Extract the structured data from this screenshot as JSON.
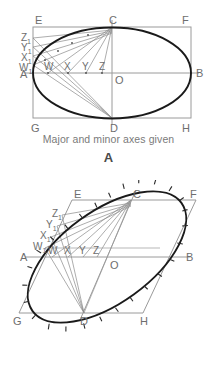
{
  "figures": [
    {
      "id": "A",
      "caption": "Major and minor axes given",
      "letter": "A",
      "labels": {
        "E": "E",
        "C": "C",
        "F": "F",
        "A": "A",
        "B": "B",
        "O": "O",
        "G": "G",
        "D": "D",
        "H": "H",
        "W": "W",
        "X": "X",
        "Y": "Y",
        "Z": "Z",
        "W1": "W",
        "X1": "X",
        "Y1": "Y",
        "Z1": "Z",
        "sub": "1"
      }
    },
    {
      "id": "B",
      "caption": "Conjugate diameters given",
      "letter": "B",
      "labels": {
        "E": "E",
        "C": "C",
        "F": "F",
        "A": "A",
        "B": "B",
        "O": "O",
        "G": "G",
        "D": "D",
        "H": "H",
        "W": "W",
        "X": "X",
        "Y": "Y",
        "Z": "Z",
        "W1": "W",
        "X1": "X",
        "Y1": "Y",
        "Z1": "Z",
        "sub": "1"
      }
    }
  ],
  "colors": {
    "curve": "#1a1a1a",
    "construction": "#8a8a8a",
    "frame": "#9a9a9a",
    "text": "#6e6e6e",
    "background": "#ffffff"
  },
  "geometry": {
    "figure_a": {
      "type": "rectangle-enclosed-ellipse",
      "rect": {
        "left": 33,
        "top": 27,
        "right": 191,
        "bottom": 118
      },
      "center_O": {
        "x": 112,
        "y": 73
      },
      "semi_major": 79,
      "semi_minor": 46,
      "axis_points_on_AO": [
        48,
        68,
        86,
        102
      ],
      "axis_points_on_AE": [
        38,
        48,
        57,
        65
      ]
    },
    "figure_b": {
      "type": "parallelogram-enclosed-ellipse",
      "parallelogram": {
        "E": [
          72,
          200
        ],
        "F": [
          196,
          200
        ],
        "H": [
          143,
          313
        ],
        "G": [
          19,
          313
        ]
      },
      "A": [
        33,
        257
      ],
      "B": [
        181,
        257
      ],
      "C": [
        131,
        200
      ],
      "D": [
        84,
        313
      ],
      "center_O": {
        "x": 107,
        "y": 257
      },
      "axis_points_on_AO": [
        52,
        68,
        83,
        97
      ],
      "axis_points_on_AE": [
        221,
        232,
        243,
        250
      ]
    }
  }
}
